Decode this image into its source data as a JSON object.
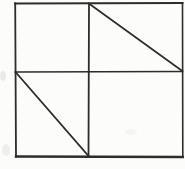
{
  "figure": {
    "background_color": "#fcfcfb",
    "stroke_color": "#2d2d2b",
    "stroke_width": 1.7,
    "canvas": {
      "width": 185,
      "height": 169
    },
    "lines": [
      {
        "name": "square-top-edge",
        "x1": 15,
        "y1": 3.5,
        "x2": 182.5,
        "y2": 3,
        "width": 2.0
      },
      {
        "name": "square-left-edge",
        "x1": 15.2,
        "y1": 3.5,
        "x2": 16,
        "y2": 156.5,
        "width": 1.8
      },
      {
        "name": "square-right-edge",
        "x1": 182.5,
        "y1": 3,
        "x2": 182.8,
        "y2": 156.5,
        "width": 1.6
      },
      {
        "name": "square-bottom-edge",
        "x1": 16,
        "y1": 156.5,
        "x2": 182.8,
        "y2": 157,
        "width": 2.4
      },
      {
        "name": "horizontal-midline",
        "x1": 15.2,
        "y1": 72,
        "x2": 182.5,
        "y2": 71.5,
        "width": 1.6
      },
      {
        "name": "vertical-midline",
        "x1": 89,
        "y1": 3.5,
        "x2": 88.5,
        "y2": 156.5,
        "width": 1.8
      },
      {
        "name": "diagonal-top-right",
        "x1": 89.5,
        "y1": 4,
        "x2": 182.3,
        "y2": 71,
        "width": 1.7
      },
      {
        "name": "diagonal-bottom-left",
        "x1": 16,
        "y1": 72.5,
        "x2": 88.5,
        "y2": 156,
        "width": 1.7
      }
    ],
    "artifacts": [
      {
        "name": "scan-smudge-left-margin",
        "cx": 3,
        "cy": 76,
        "rx": 3,
        "ry": 5,
        "color": "#9a9a96",
        "opacity": 0.18
      },
      {
        "name": "scan-smudge-bottom-left",
        "cx": 6,
        "cy": 150,
        "rx": 4,
        "ry": 6,
        "color": "#9a9a96",
        "opacity": 0.14
      },
      {
        "name": "scan-smudge-lower-right",
        "cx": 131,
        "cy": 132,
        "rx": 6,
        "ry": 3,
        "color": "#b5b5b0",
        "opacity": 0.1
      }
    ]
  }
}
